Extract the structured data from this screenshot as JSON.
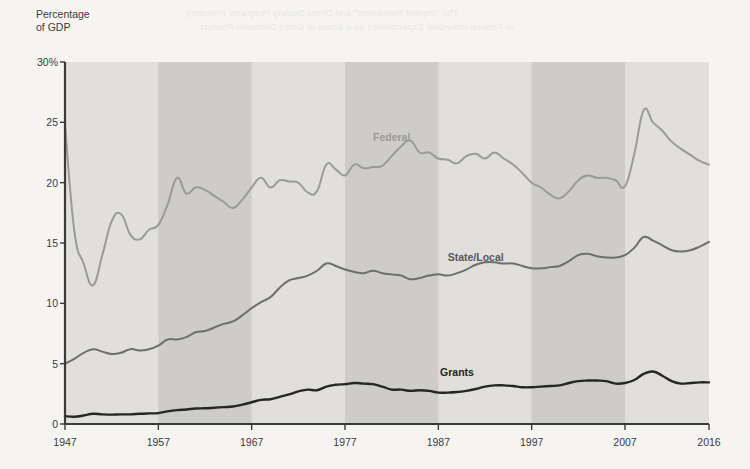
{
  "axis_title": "Percentage\nof GDP",
  "ghost_text": {
    "line1": "The “Implicit Revolution” and Direct Society Programs Inventory",
    "line2": "of Federal Individual Expenditures as a Share of Gross Domestic Product"
  },
  "colors": {
    "federal": "#9a9a96",
    "state_local": "#6e6e70",
    "grants": "#262626",
    "band_light": "#e0dfdb",
    "band_dark": "#cdccc8",
    "plot_background": "#e0dfdb",
    "axis": "#3a3a3a",
    "page_background": "#f5f4f1",
    "text": "#3c3c3c"
  },
  "chart_data": {
    "type": "line",
    "title": "",
    "xlabel": "",
    "ylabel": "Percentage of GDP",
    "xlim": [
      1947,
      2016
    ],
    "ylim": [
      0,
      30
    ],
    "yticks": [
      0,
      5,
      10,
      15,
      20,
      25,
      30
    ],
    "ytick_labels": [
      "0",
      "5",
      "10",
      "15",
      "20",
      "25",
      "30%"
    ],
    "xticks": [
      1947,
      1957,
      1967,
      1977,
      1987,
      1997,
      2007,
      2016
    ],
    "xtick_labels": [
      "1947",
      "1957",
      "1967",
      "1977",
      "1987",
      "1997",
      "2007",
      "2016"
    ],
    "grid": false,
    "legend": "inline-labels",
    "shaded_decade_bands": [
      {
        "start": 1947,
        "end": 1957,
        "tone": "light"
      },
      {
        "start": 1957,
        "end": 1967,
        "tone": "dark"
      },
      {
        "start": 1967,
        "end": 1977,
        "tone": "light"
      },
      {
        "start": 1977,
        "end": 1987,
        "tone": "dark"
      },
      {
        "start": 1987,
        "end": 1997,
        "tone": "light"
      },
      {
        "start": 1997,
        "end": 2007,
        "tone": "dark"
      },
      {
        "start": 2007,
        "end": 2016,
        "tone": "light"
      }
    ],
    "x": [
      1947,
      1948,
      1949,
      1950,
      1951,
      1952,
      1953,
      1954,
      1955,
      1956,
      1957,
      1958,
      1959,
      1960,
      1961,
      1962,
      1963,
      1964,
      1965,
      1966,
      1967,
      1968,
      1969,
      1970,
      1971,
      1972,
      1973,
      1974,
      1975,
      1976,
      1977,
      1978,
      1979,
      1980,
      1981,
      1982,
      1983,
      1984,
      1985,
      1986,
      1987,
      1988,
      1989,
      1990,
      1991,
      1992,
      1993,
      1994,
      1995,
      1996,
      1997,
      1998,
      1999,
      2000,
      2001,
      2002,
      2003,
      2004,
      2005,
      2006,
      2007,
      2008,
      2009,
      2010,
      2011,
      2012,
      2013,
      2014,
      2015,
      2016
    ],
    "series": [
      {
        "name": "Federal",
        "color": "#9a9a96",
        "label_position": {
          "x": 1982,
          "y": 23.8
        },
        "values": [
          24.8,
          16.0,
          13.3,
          11.5,
          14.0,
          16.8,
          17.4,
          15.7,
          15.3,
          16.1,
          16.5,
          18.2,
          20.4,
          19.1,
          19.6,
          19.4,
          18.9,
          18.4,
          17.9,
          18.6,
          19.6,
          20.4,
          19.6,
          20.2,
          20.1,
          20.0,
          19.2,
          19.3,
          21.5,
          21.1,
          20.6,
          21.5,
          21.2,
          21.3,
          21.4,
          22.2,
          23.0,
          23.5,
          22.5,
          22.5,
          22.0,
          21.9,
          21.6,
          22.2,
          22.4,
          22.0,
          22.5,
          22.0,
          21.5,
          20.8,
          20.0,
          19.6,
          19.0,
          18.7,
          19.3,
          20.2,
          20.6,
          20.4,
          20.4,
          20.2,
          19.7,
          22.4,
          26.0,
          25.0,
          24.3,
          23.4,
          22.8,
          22.3,
          21.8,
          21.5
        ]
      },
      {
        "name": "State/Local",
        "color": "#6e6e70",
        "label_position": {
          "x": 1991,
          "y": 13.8
        },
        "values": [
          5.0,
          5.4,
          5.9,
          6.2,
          6.0,
          5.8,
          5.9,
          6.2,
          6.1,
          6.2,
          6.5,
          7.0,
          7.0,
          7.2,
          7.6,
          7.7,
          8.0,
          8.3,
          8.5,
          9.0,
          9.6,
          10.1,
          10.5,
          11.3,
          11.9,
          12.1,
          12.3,
          12.7,
          13.3,
          13.1,
          12.8,
          12.6,
          12.5,
          12.7,
          12.5,
          12.4,
          12.3,
          12.0,
          12.1,
          12.3,
          12.4,
          12.3,
          12.5,
          12.8,
          13.2,
          13.4,
          13.4,
          13.3,
          13.3,
          13.1,
          12.9,
          12.9,
          13.0,
          13.1,
          13.5,
          14.0,
          14.1,
          13.9,
          13.8,
          13.8,
          14.0,
          14.6,
          15.5,
          15.2,
          14.8,
          14.4,
          14.3,
          14.4,
          14.7,
          15.1
        ]
      },
      {
        "name": "Grants",
        "color": "#262626",
        "label_position": {
          "x": 1989,
          "y": 4.3
        },
        "values": [
          0.65,
          0.6,
          0.7,
          0.85,
          0.8,
          0.78,
          0.8,
          0.8,
          0.85,
          0.88,
          0.9,
          1.05,
          1.15,
          1.2,
          1.28,
          1.3,
          1.35,
          1.4,
          1.45,
          1.6,
          1.8,
          2.0,
          2.05,
          2.25,
          2.45,
          2.7,
          2.85,
          2.8,
          3.1,
          3.25,
          3.3,
          3.4,
          3.35,
          3.3,
          3.1,
          2.85,
          2.85,
          2.75,
          2.8,
          2.75,
          2.6,
          2.6,
          2.65,
          2.75,
          2.9,
          3.1,
          3.2,
          3.2,
          3.15,
          3.05,
          3.05,
          3.1,
          3.15,
          3.2,
          3.4,
          3.55,
          3.6,
          3.6,
          3.55,
          3.35,
          3.4,
          3.65,
          4.15,
          4.35,
          4.0,
          3.55,
          3.35,
          3.4,
          3.45,
          3.45
        ]
      }
    ]
  }
}
